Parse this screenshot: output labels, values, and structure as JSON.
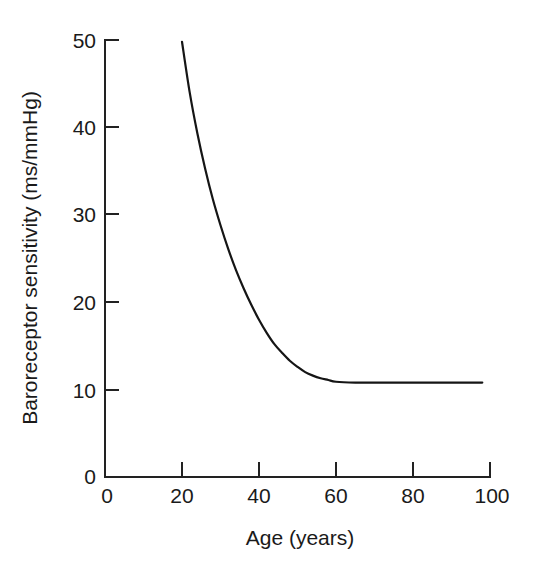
{
  "chart_data": {
    "type": "line",
    "title": "",
    "xlabel": "Age (years)",
    "ylabel": "Baroreceptor sensitivity (ms/mmHg)",
    "xlim": [
      0,
      100
    ],
    "ylim": [
      0,
      50
    ],
    "xticks": [
      0,
      20,
      40,
      60,
      80,
      100
    ],
    "xtick_labels": [
      "0",
      "20",
      "40",
      "60",
      "80",
      "100"
    ],
    "yticks": [
      0,
      10,
      20,
      30,
      40,
      50
    ],
    "ytick_labels": [
      "0",
      "10",
      "20",
      "30",
      "40",
      "50"
    ],
    "grid": false,
    "legend": null,
    "legend_position": "none",
    "series": [
      {
        "name": "Baroreceptor sensitivity",
        "color": "#151515",
        "x": [
          20,
          22,
          24,
          26,
          28,
          30,
          32,
          34,
          36,
          38,
          40,
          42,
          44,
          46,
          48,
          50,
          52,
          54,
          56,
          58,
          60,
          65,
          70,
          75,
          80,
          85,
          90,
          95,
          98
        ],
        "y": [
          49.8,
          44.0,
          39.3,
          35.3,
          31.8,
          28.8,
          26.1,
          23.7,
          21.6,
          19.7,
          18.0,
          16.5,
          15.2,
          14.2,
          13.3,
          12.6,
          12.0,
          11.6,
          11.3,
          11.1,
          10.9,
          10.8,
          10.8,
          10.8,
          10.8,
          10.8,
          10.8,
          10.8,
          10.8
        ]
      }
    ],
    "annotations": []
  },
  "axes": {
    "x_axis_name": "Age (years)",
    "y_axis_name": "Baroreceptor sensitivity (ms/mmHg)"
  }
}
